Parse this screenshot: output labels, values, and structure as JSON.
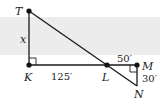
{
  "figure": {
    "type": "similar-triangles-geometry",
    "points": {
      "T": {
        "label": "T",
        "x": 29,
        "y": 11
      },
      "K": {
        "label": "K",
        "x": 29,
        "y": 65
      },
      "L": {
        "label": "L",
        "x": 107,
        "y": 65
      },
      "M": {
        "label": "M",
        "x": 137,
        "y": 65
      },
      "N": {
        "label": "N",
        "x": 137,
        "y": 86
      }
    },
    "measurements": {
      "TK": "x",
      "KL": "125′",
      "LM": "50′",
      "MN": "30′"
    },
    "right_angles": [
      "K",
      "M"
    ],
    "colors": {
      "line": "#1a1a1a",
      "band": "#ececec"
    }
  }
}
